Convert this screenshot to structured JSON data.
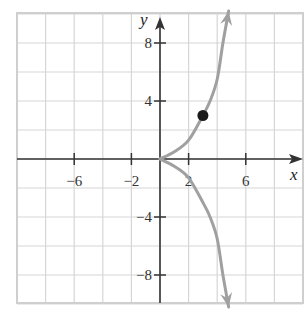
{
  "chart_data": {
    "type": "line",
    "title": "",
    "xlabel": "x",
    "ylabel": "y",
    "xlim": [
      -10,
      10
    ],
    "ylim": [
      -10,
      10
    ],
    "grid": true,
    "grid_step": 2,
    "x_tick_labels": [
      "-6",
      "-2",
      "2",
      "6"
    ],
    "x_tick_values": [
      -6,
      -2,
      2,
      6
    ],
    "y_tick_labels": [
      "8",
      "4",
      "-4",
      "-8"
    ],
    "y_tick_values": [
      8,
      4,
      -4,
      -8
    ],
    "series": [
      {
        "name": "upper branch",
        "x": [
          0,
          1,
          2,
          3,
          3.5,
          4,
          4.4,
          4.8
        ],
        "y": [
          0,
          0.5,
          1.3,
          3,
          4,
          5.5,
          8,
          10.2
        ],
        "arrow_end": true
      },
      {
        "name": "lower branch",
        "x": [
          0,
          1,
          2,
          3,
          3.5,
          4,
          4.4,
          4.8
        ],
        "y": [
          0,
          -0.5,
          -1.3,
          -3,
          -4,
          -5.5,
          -8,
          -10.2
        ],
        "arrow_end": true
      }
    ],
    "points": [
      {
        "x": 3,
        "y": 3
      }
    ],
    "colors": {
      "curve": "#a0a0a0",
      "axis": "#333333",
      "grid": "#d6d6d6",
      "point": "#1a1a1a"
    }
  }
}
